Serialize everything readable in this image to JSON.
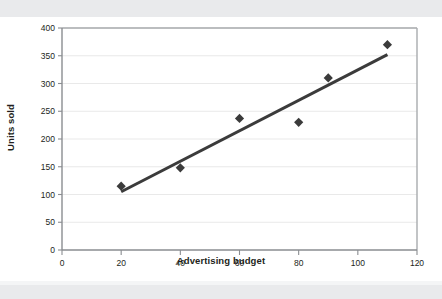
{
  "figure": {
    "background_color": "#ffffff",
    "page_band_color": "#e9eaec"
  },
  "chart_data": {
    "type": "scatter",
    "title": "",
    "subtitle": "",
    "xlabel": "Advertising budget",
    "ylabel": "Units sold",
    "xlim": [
      0,
      120
    ],
    "ylim": [
      0,
      400
    ],
    "xticks": [
      0,
      20,
      40,
      60,
      80,
      100,
      120
    ],
    "yticks": [
      0,
      50,
      100,
      150,
      200,
      250,
      300,
      350,
      400
    ],
    "xtick_labels": [
      "0",
      "20",
      "40",
      "60",
      "80",
      "100",
      "120"
    ],
    "ytick_labels": [
      "0",
      "50",
      "100",
      "150",
      "200",
      "250",
      "300",
      "350",
      "400"
    ],
    "grid": {
      "horizontal": true,
      "vertical": false,
      "color": "#e3e3e3"
    },
    "legend": {
      "visible": false,
      "position": "none",
      "entries": []
    },
    "series": [
      {
        "name": "Units sold",
        "type": "scatter",
        "marker": "diamond",
        "marker_size": 8,
        "color": "#3b3b3b",
        "points": [
          {
            "x": 20,
            "y": 115
          },
          {
            "x": 40,
            "y": 148
          },
          {
            "x": 60,
            "y": 237
          },
          {
            "x": 80,
            "y": 230
          },
          {
            "x": 90,
            "y": 310
          },
          {
            "x": 110,
            "y": 370
          }
        ]
      },
      {
        "name": "Trendline",
        "type": "line",
        "color": "#3b3b3b",
        "line_width": 3,
        "points": [
          {
            "x": 20,
            "y": 105
          },
          {
            "x": 110,
            "y": 352
          }
        ]
      }
    ],
    "annotations": []
  },
  "axes": {
    "axis_line_color": "#8a8d91",
    "plot_border_color": "#a8abae",
    "tick_color": "#8a8d91"
  }
}
